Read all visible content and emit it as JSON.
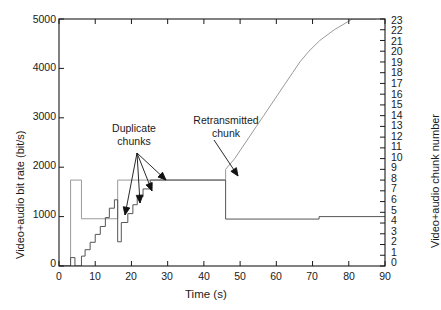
{
  "chart_data": {
    "type": "line",
    "title": "",
    "xlabel": "Time (s)",
    "ylabel": "Video+audio bit rate (bit/s)",
    "y2label": "Video+audio chunk number",
    "xlim": [
      0,
      90
    ],
    "ylim": [
      0,
      5000
    ],
    "y2lim": [
      0,
      23
    ],
    "grid": false,
    "legend": null,
    "xticks": [
      0,
      10,
      20,
      30,
      40,
      50,
      60,
      70,
      80,
      90
    ],
    "xtick_labels": [
      "0",
      "10",
      "20",
      "30",
      "40",
      "50",
      "60",
      "70",
      "80",
      "90"
    ],
    "yticks": [
      0,
      1000,
      2000,
      3000,
      4000,
      5000
    ],
    "ytick_labels": [
      "0",
      "1000",
      "2000",
      "3000",
      "4000",
      "5000"
    ],
    "y2ticks": [
      0,
      1,
      2,
      3,
      4,
      5,
      6,
      7,
      8,
      9,
      10,
      11,
      12,
      13,
      14,
      15,
      16,
      17,
      18,
      19,
      20,
      21,
      22,
      23
    ],
    "y2tick_labels": [
      "0",
      "1",
      "2",
      "3",
      "4",
      "5",
      "6",
      "7",
      "8",
      "9",
      "10",
      "11",
      "12",
      "13",
      "14",
      "15",
      "16",
      "17",
      "18",
      "19",
      "20",
      "21",
      "22",
      "23"
    ],
    "series": [
      {
        "name": "Video+audio bit rate (bit/s)",
        "axis": "left",
        "style": "step",
        "color": "#555555",
        "points": [
          [
            0,
            0
          ],
          [
            3.2,
            0
          ],
          [
            3.2,
            170
          ],
          [
            4.4,
            170
          ],
          [
            4.4,
            0
          ],
          [
            6.2,
            0
          ],
          [
            6.2,
            200
          ],
          [
            7.2,
            200
          ],
          [
            7.2,
            330
          ],
          [
            8.6,
            330
          ],
          [
            8.6,
            480
          ],
          [
            10.0,
            480
          ],
          [
            10.0,
            640
          ],
          [
            11.4,
            640
          ],
          [
            11.4,
            800
          ],
          [
            12.8,
            800
          ],
          [
            12.8,
            980
          ],
          [
            13.9,
            980
          ],
          [
            13.9,
            1170
          ],
          [
            15.3,
            1170
          ],
          [
            15.3,
            1340
          ],
          [
            16.2,
            1340
          ],
          [
            16.2,
            490
          ],
          [
            17.2,
            490
          ],
          [
            17.2,
            880
          ],
          [
            19.0,
            880
          ],
          [
            19.0,
            1060
          ],
          [
            20.4,
            1060
          ],
          [
            20.4,
            1240
          ],
          [
            21.6,
            1240
          ],
          [
            21.6,
            1400
          ],
          [
            23.2,
            1400
          ],
          [
            23.2,
            1560
          ],
          [
            25.2,
            1560
          ],
          [
            25.2,
            1740
          ],
          [
            46.0,
            1740
          ],
          [
            46.0,
            950
          ],
          [
            71.8,
            950
          ],
          [
            71.8,
            1000
          ],
          [
            90,
            1000
          ]
        ]
      },
      {
        "name": "Video+audio chunk number",
        "axis": "right",
        "style": "step",
        "color": "#9a9a9a",
        "points": [
          [
            0,
            0
          ],
          [
            3.2,
            0
          ],
          [
            3.2,
            8
          ],
          [
            6.2,
            8
          ],
          [
            6.2,
            4.4
          ],
          [
            16.2,
            4.4
          ],
          [
            16.2,
            8
          ],
          [
            25.2,
            8
          ],
          [
            25.2,
            8
          ],
          [
            46.0,
            8
          ],
          [
            46.0,
            8
          ],
          [
            46.0,
            9
          ],
          [
            48.5,
            10
          ],
          [
            50.5,
            11
          ],
          [
            52.5,
            12
          ],
          [
            54.5,
            13
          ],
          [
            56.5,
            14
          ],
          [
            58.5,
            15
          ],
          [
            60.5,
            16
          ],
          [
            62.5,
            17
          ],
          [
            64.5,
            18
          ],
          [
            66.5,
            19
          ],
          [
            69.0,
            20
          ],
          [
            72.0,
            21
          ],
          [
            76.0,
            22
          ],
          [
            81.0,
            23
          ],
          [
            87.5,
            23
          ]
        ]
      }
    ],
    "annotations": [
      {
        "text_line1": "Duplicate",
        "text_line2": "chunks",
        "kind": "label-arrows",
        "n_arrows": 4
      },
      {
        "text_line1": "Retransmitted",
        "text_line2": "chunk",
        "kind": "label-arrow",
        "n_arrows": 1
      }
    ]
  },
  "axes": {
    "x_label": "Time (s)",
    "y_label": "Video+audio bit rate (bit/s)",
    "y2_label": "Video+audio chunk number"
  },
  "annotations": {
    "duplicate_line1": "Duplicate",
    "duplicate_line2": "chunks",
    "retransmitted_line1": "Retransmitted",
    "retransmitted_line2": "chunk"
  },
  "colors": {
    "axis": "#1a1a1a",
    "bitrate_trace": "#555555",
    "chunk_trace": "#9a9a9a",
    "background": "#ffffff"
  }
}
